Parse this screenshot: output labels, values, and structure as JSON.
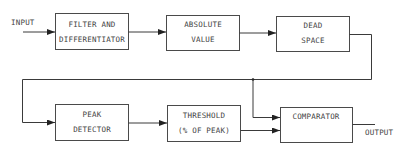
{
  "diagram": {
    "type": "block-diagram",
    "input_label": "INPUT",
    "output_label": "OUTPUT",
    "blocks": [
      {
        "id": "filter",
        "lines": [
          "FILTER  AND",
          "DIFFERENTIATOR"
        ]
      },
      {
        "id": "absolute",
        "lines": [
          "ABSOLUTE",
          "VALUE"
        ]
      },
      {
        "id": "deadspace",
        "lines": [
          "DEAD",
          "SPACE"
        ]
      },
      {
        "id": "peak",
        "lines": [
          "PEAK",
          "DETECTOR"
        ]
      },
      {
        "id": "threshold",
        "lines": [
          "THRESHOLD",
          "(% OF PEAK)"
        ]
      },
      {
        "id": "comparator",
        "lines": [
          "COMPARATOR"
        ]
      }
    ],
    "connections": [
      {
        "from": "input",
        "to": "filter"
      },
      {
        "from": "filter",
        "to": "absolute"
      },
      {
        "from": "absolute",
        "to": "deadspace"
      },
      {
        "from": "deadspace",
        "to": "peak"
      },
      {
        "from": "deadspace",
        "to": "comparator"
      },
      {
        "from": "peak",
        "to": "threshold"
      },
      {
        "from": "threshold",
        "to": "comparator"
      },
      {
        "from": "comparator",
        "to": "output"
      }
    ],
    "colors": {
      "line": "#3a3a3a",
      "text": "#444444",
      "background": "#ffffff"
    }
  }
}
